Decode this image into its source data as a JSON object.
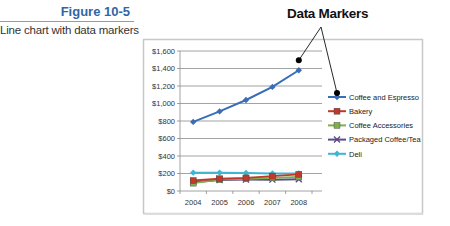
{
  "figure": {
    "number": "Figure 10-5",
    "caption": "Line chart with data markers"
  },
  "callout": {
    "title": "Data Markers"
  },
  "chart_data": {
    "type": "line",
    "title": "",
    "xlabel": "",
    "ylabel": "",
    "categories": [
      "2004",
      "2005",
      "2006",
      "2007",
      "2008"
    ],
    "ylim": [
      0,
      1600
    ],
    "y_ticks": [
      "$0",
      "$200",
      "$400",
      "$600",
      "$800",
      "$1,000",
      "$1,200",
      "$1,400",
      "$1,600"
    ],
    "grid": true,
    "legend_position": "right",
    "series": [
      {
        "name": "Coffee and Espresso",
        "color": "#3a6db5",
        "values": [
          790,
          910,
          1040,
          1190,
          1380
        ]
      },
      {
        "name": "Bakery",
        "color": "#c0392b",
        "values": [
          120,
          140,
          150,
          170,
          190
        ]
      },
      {
        "name": "Coffee Accessories",
        "color": "#7fb04a",
        "values": [
          90,
          130,
          140,
          150,
          160
        ]
      },
      {
        "name": "Packaged Coffee/Tea",
        "color": "#5b4b8a",
        "values": [
          100,
          125,
          130,
          130,
          135
        ]
      },
      {
        "name": "Deli",
        "color": "#3fb6cf",
        "values": [
          210,
          210,
          205,
          200,
          200
        ]
      }
    ]
  }
}
